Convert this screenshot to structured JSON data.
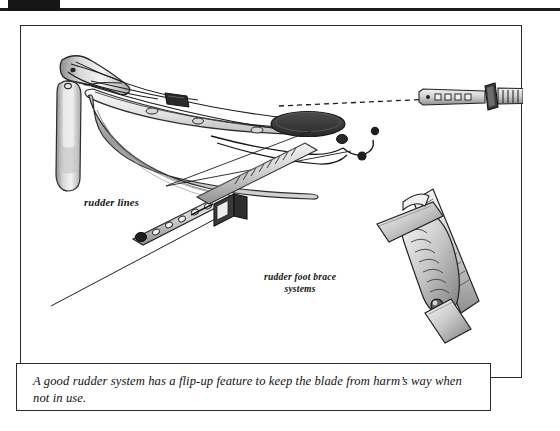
{
  "page": {
    "background_color": "#ffffff",
    "ink_color": "#1a1a1a",
    "top_rule_color": "#1c1c1c"
  },
  "figure": {
    "frame_border_color": "#2a2a2a",
    "labels": {
      "rudder_lines": "rudder lines",
      "foot_brace_line1": "rudder foot brace",
      "foot_brace_line2": "systems"
    },
    "illustrations": [
      {
        "name": "kayak-stern-with-rudder",
        "description": "Pen-and-ink drawing of a kayak stern showing a flip-up rudder blade on its mounting bracket, deck lines, a round hatch cover, and rudder control lines running forward."
      },
      {
        "name": "foot-brace-pedal-detail",
        "description": "Small inset at upper right of a rudder foot brace pedal mounted on a toothed rail, connected by a dashed leader line to the kayak cockpit."
      },
      {
        "name": "foot-brace-rail-system",
        "description": "Lower centre inset of a sliding foot brace rail with adjustment holes, a toothed track and a pivoting pedal."
      },
      {
        "name": "rudder-pedal-detail",
        "description": "Lower right inset of a tilting rudder pedal with a ribbed footplate and pivot bolt."
      }
    ]
  },
  "caption": {
    "text": "A good rudder system has a flip-up feature to keep the blade from harm’s way when not in use."
  }
}
